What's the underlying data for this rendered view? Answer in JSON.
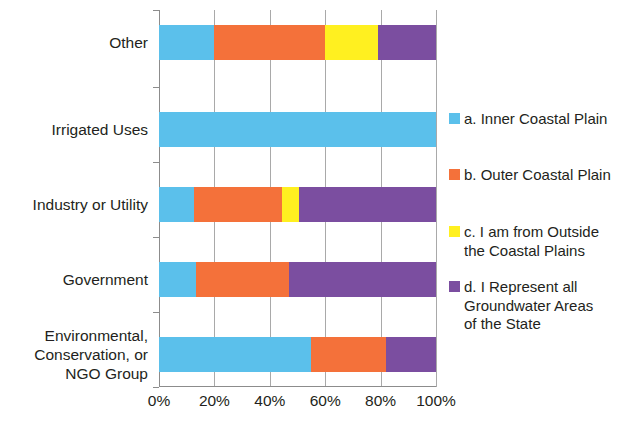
{
  "chart_data": {
    "type": "bar",
    "orientation": "horizontal",
    "stacked": true,
    "normalized": true,
    "title": "",
    "subtitle": "",
    "xlabel": "",
    "ylabel": "",
    "xlim": [
      0,
      100
    ],
    "xticks": [
      0,
      20,
      40,
      60,
      80,
      100
    ],
    "xtick_labels": [
      "0%",
      "20%",
      "40%",
      "60%",
      "80%",
      "100%"
    ],
    "grid": true,
    "grid_axis": "x",
    "legend_position": "right",
    "categories": [
      "Other",
      "Irrigated Uses",
      "Industry or Utility",
      "Government",
      "Environmental,\nConservation, or\nNGO Group"
    ],
    "series": [
      {
        "name": "a. Inner Coastal Plain",
        "color": "#5BC0EB",
        "values": [
          20,
          100,
          12.5,
          13.5,
          55
        ]
      },
      {
        "name": "b. Outer Coastal Plain",
        "color": "#F4713A",
        "values": [
          40,
          0,
          32,
          33.5,
          27
        ]
      },
      {
        "name": "c. I am from Outside\nthe Coastal Plains",
        "color": "#FFF020",
        "values": [
          19,
          0,
          6,
          0,
          0
        ]
      },
      {
        "name": "d. I Represent all\nGroundwater Areas\nof the State",
        "color": "#7B4EA0",
        "values": [
          21,
          0,
          49.5,
          53,
          18
        ]
      }
    ]
  },
  "legend": {
    "items": [
      {
        "label": "a. Inner Coastal Plain",
        "color": "#5BC0EB"
      },
      {
        "label": "b. Outer Coastal Plain",
        "color": "#F4713A"
      },
      {
        "label": "c. I am from Outside\nthe Coastal Plains",
        "color": "#FFF020"
      },
      {
        "label": "d. I Represent all\nGroundwater Areas\nof the State",
        "color": "#7B4EA0"
      }
    ]
  },
  "axis": {
    "x_tick_labels": [
      "0%",
      "20%",
      "40%",
      "60%",
      "80%",
      "100%"
    ],
    "y_tick_labels": [
      "Other",
      "Irrigated Uses",
      "Industry or Utility",
      "Government",
      "Environmental,\nConservation, or\nNGO Group"
    ]
  },
  "colors": {
    "inner_coastal_plain": "#5BC0EB",
    "outer_coastal_plain": "#F4713A",
    "outside_coastal_plains": "#FFF020",
    "all_groundwater_areas": "#7B4EA0",
    "gridline": "#a9a9a9",
    "axis": "#8c8c8c",
    "text": "#231f20"
  }
}
